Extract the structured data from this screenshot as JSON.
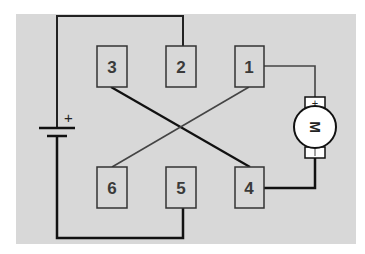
{
  "diagram": {
    "type": "relay wiring / DPDT motor reversing circuit",
    "colors": {
      "background": "#d8d8d8",
      "wire_dark": "#111111",
      "wire_light": "#444444",
      "box_border": "#333333"
    },
    "terminals": [
      {
        "id": "1",
        "label": "1"
      },
      {
        "id": "2",
        "label": "2"
      },
      {
        "id": "3",
        "label": "3"
      },
      {
        "id": "4",
        "label": "4"
      },
      {
        "id": "5",
        "label": "5"
      },
      {
        "id": "6",
        "label": "6"
      }
    ],
    "battery": {
      "plus_label": "+"
    },
    "motor": {
      "label": "M",
      "plus_label": "+",
      "minus_label": "−"
    },
    "connections": [
      {
        "from": "battery+",
        "to": "2"
      },
      {
        "from": "battery-",
        "to": "5"
      },
      {
        "from": "3",
        "to": "4"
      },
      {
        "from": "6",
        "to": "1"
      },
      {
        "from": "1",
        "to": "motor+"
      },
      {
        "from": "4",
        "to": "motor-"
      }
    ]
  }
}
